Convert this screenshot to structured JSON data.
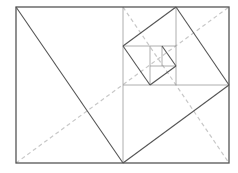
{
  "diagram": {
    "colors": {
      "outline": "#555555",
      "grid": "#9a9a9a",
      "dashed": "#c8c8c8",
      "background": "#ffffff"
    },
    "outer_rect": {
      "x": 16,
      "y": 7,
      "w": 213,
      "h": 156
    },
    "grid_lines": [
      {
        "x1": 123,
        "y1": 7,
        "x2": 123,
        "y2": 163
      },
      {
        "x1": 123,
        "y1": 85,
        "x2": 229,
        "y2": 85
      },
      {
        "x1": 176,
        "y1": 7,
        "x2": 176,
        "y2": 85
      },
      {
        "x1": 123,
        "y1": 46,
        "x2": 176,
        "y2": 46
      },
      {
        "x1": 150,
        "y1": 46,
        "x2": 150,
        "y2": 85
      },
      {
        "x1": 150,
        "y1": 66,
        "x2": 176,
        "y2": 66
      },
      {
        "x1": 162,
        "y1": 46,
        "x2": 162,
        "y2": 66
      }
    ],
    "diagonal_lines": [
      {
        "x1": 16,
        "y1": 7,
        "x2": 123,
        "y2": 163
      },
      {
        "x1": 123,
        "y1": 163,
        "x2": 229,
        "y2": 85
      },
      {
        "x1": 229,
        "y1": 85,
        "x2": 176,
        "y2": 7
      },
      {
        "x1": 176,
        "y1": 7,
        "x2": 123,
        "y2": 46
      },
      {
        "x1": 123,
        "y1": 46,
        "x2": 150,
        "y2": 85
      },
      {
        "x1": 150,
        "y1": 85,
        "x2": 176,
        "y2": 66
      },
      {
        "x1": 176,
        "y1": 66,
        "x2": 162,
        "y2": 46
      }
    ],
    "dashed_lines": [
      {
        "x1": 16,
        "y1": 163,
        "x2": 229,
        "y2": 7
      },
      {
        "x1": 123,
        "y1": 7,
        "x2": 229,
        "y2": 163
      }
    ]
  }
}
